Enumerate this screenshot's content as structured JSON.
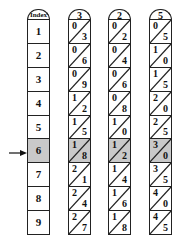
{
  "index_rod": {
    "header": "Index",
    "rows": [
      "1",
      "2",
      "3",
      "4",
      "5",
      "6",
      "7",
      "8",
      "9"
    ]
  },
  "highlighted_row": "6",
  "rods": [
    {
      "header": "3",
      "cells": [
        {
          "tens": "0",
          "units": "3"
        },
        {
          "tens": "0",
          "units": "6"
        },
        {
          "tens": "0",
          "units": "9"
        },
        {
          "tens": "1",
          "units": "2"
        },
        {
          "tens": "1",
          "units": "5"
        },
        {
          "tens": "1",
          "units": "8"
        },
        {
          "tens": "2",
          "units": "1"
        },
        {
          "tens": "2",
          "units": "4"
        },
        {
          "tens": "2",
          "units": "7"
        }
      ]
    },
    {
      "header": "2",
      "cells": [
        {
          "tens": "0",
          "units": "2"
        },
        {
          "tens": "0",
          "units": "4"
        },
        {
          "tens": "0",
          "units": "6"
        },
        {
          "tens": "0",
          "units": "8"
        },
        {
          "tens": "1",
          "units": "0"
        },
        {
          "tens": "1",
          "units": "2"
        },
        {
          "tens": "1",
          "units": "4"
        },
        {
          "tens": "1",
          "units": "6"
        },
        {
          "tens": "1",
          "units": "8"
        }
      ]
    },
    {
      "header": "5",
      "cells": [
        {
          "tens": "0",
          "units": "5"
        },
        {
          "tens": "1",
          "units": "0"
        },
        {
          "tens": "1",
          "units": "5"
        },
        {
          "tens": "2",
          "units": "0"
        },
        {
          "tens": "2",
          "units": "5"
        },
        {
          "tens": "3",
          "units": "0"
        },
        {
          "tens": "3",
          "units": "5"
        },
        {
          "tens": "4",
          "units": "0"
        },
        {
          "tens": "4",
          "units": "5"
        }
      ]
    }
  ],
  "colors": {
    "highlight": "#c9c9c9",
    "line": "#222222"
  }
}
